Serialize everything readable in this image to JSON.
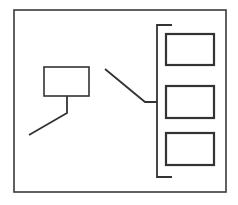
{
  "figure": {
    "title": "",
    "background_color": "#ffffff",
    "stroke_color": "#333333",
    "frame_stroke_color": "#3a3a3a",
    "fill_color": "#ffffff",
    "width": 238,
    "height": 205
  },
  "diagram_data": {
    "type": "line-diagram",
    "description": "Schematic line drawing: an outer frame containing one left rectangle with a descending leader line, a diagonal pointer line, and a vertical bracket grouping three stacked rectangles at the right.",
    "frame": {
      "name": "outer-frame",
      "x": 14,
      "y": 10,
      "width": 212,
      "height": 182,
      "stroke_width": 1.6
    },
    "shapes": [
      {
        "name": "left-rectangle",
        "label": "",
        "x": 44,
        "y": 67,
        "width": 45,
        "height": 29,
        "stroke_width": 1.6
      },
      {
        "name": "right-rectangle-top",
        "label": "",
        "x": 166,
        "y": 34,
        "width": 48,
        "height": 31,
        "stroke_width": 2.2
      },
      {
        "name": "right-rectangle-middle",
        "label": "",
        "x": 166,
        "y": 86,
        "width": 48,
        "height": 32,
        "stroke_width": 2.2
      },
      {
        "name": "right-rectangle-bottom",
        "label": "",
        "x": 166,
        "y": 133,
        "width": 48,
        "height": 32,
        "stroke_width": 2.2
      }
    ],
    "connectors": [
      {
        "name": "left-rectangle-leader",
        "points": "67,96 67,113 29,135",
        "stroke_width": 1.8
      },
      {
        "name": "bracket-pointer",
        "points": "105,69 145,102 157,102",
        "stroke_width": 1.8
      },
      {
        "name": "group-bracket",
        "points": "172,25 157,25 157,177 172,177",
        "stroke_width": 1.8
      }
    ]
  }
}
